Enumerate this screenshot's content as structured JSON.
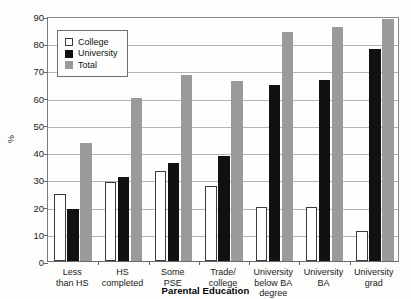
{
  "chart_data": {
    "type": "bar",
    "title": "",
    "xlabel": "Parental Education",
    "ylabel": "%",
    "ylim": [
      0,
      90
    ],
    "ytick_step": 10,
    "yticks": [
      0,
      10,
      20,
      30,
      40,
      50,
      60,
      70,
      80,
      90
    ],
    "grid": true,
    "legend_position": "top-left-inside",
    "categories": [
      "Less\nthan HS",
      "HS\ncompleted",
      "Some\nPSE",
      "Trade/\ncollege",
      "University\nbelow BA degree",
      "University\nBA",
      "University\ngrad"
    ],
    "series": [
      {
        "name": "College",
        "color": "#ffffff",
        "values": [
          24.5,
          29.0,
          33.0,
          27.5,
          20.0,
          20.0,
          11.0
        ]
      },
      {
        "name": "University",
        "color": "#111111",
        "values": [
          19.0,
          31.0,
          36.0,
          38.5,
          64.5,
          66.5,
          78.0
        ]
      },
      {
        "name": "Total",
        "color": "#9a9a9a",
        "values": [
          43.5,
          60.0,
          68.5,
          66.0,
          84.0,
          86.0,
          89.0
        ]
      }
    ]
  },
  "legend": {
    "items": [
      {
        "label": "College"
      },
      {
        "label": "University"
      },
      {
        "label": "Total"
      }
    ]
  },
  "title_remnant": ""
}
